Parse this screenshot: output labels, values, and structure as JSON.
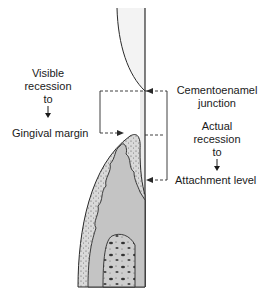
{
  "diagram": {
    "left_label": {
      "line1": "Visible",
      "line2": "recession",
      "line3": "to",
      "arrow": "down-arrow",
      "line4": "Gingival margin"
    },
    "right_top_label": {
      "line1": "Cementoenamel",
      "line2": "junction"
    },
    "right_mid_label": {
      "line1": "Actual",
      "line2": "recession",
      "line3": "to",
      "arrow": "down-arrow",
      "line4": "Attachment level"
    },
    "colors": {
      "line": "#2a2a2a",
      "gingiva_fill": "#bdbdbd",
      "epithelium_fill": "#d6d6d6",
      "bone_fill": "#cfcfcf",
      "crown_fill": "#f4f4f4"
    }
  }
}
